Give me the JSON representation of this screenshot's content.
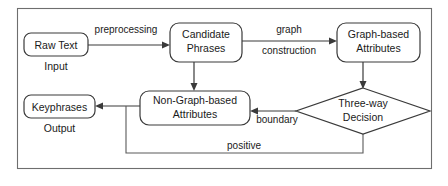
{
  "diagram": {
    "frame": {
      "name": "outer-frame"
    },
    "nodes": [
      {
        "id": "raw-text",
        "label_line1": "Raw Text",
        "label_line2": "",
        "shape": "rounded-rect"
      },
      {
        "id": "candidate-phrases",
        "label_line1": "Candidate",
        "label_line2": "Phrases",
        "shape": "rounded-rect"
      },
      {
        "id": "graph-based",
        "label_line1": "Graph-based",
        "label_line2": "Attributes",
        "shape": "rounded-rect"
      },
      {
        "id": "non-graph-based",
        "label_line1": "Non-Graph-based",
        "label_line2": "Attributes",
        "shape": "rounded-rect"
      },
      {
        "id": "three-way-decision",
        "label_line1": "Three-way",
        "label_line2": "Decision",
        "shape": "diamond"
      },
      {
        "id": "keyphrases",
        "label_line1": "Keyphrases",
        "label_line2": "",
        "shape": "rounded-rect"
      }
    ],
    "io_labels": [
      {
        "id": "input-label",
        "text": "Input"
      },
      {
        "id": "output-label",
        "text": "Output"
      }
    ],
    "edge_labels": [
      {
        "id": "preprocessing-label",
        "text": "preprocessing"
      },
      {
        "id": "graph-label",
        "text": "graph"
      },
      {
        "id": "construction-label",
        "text": "construction"
      },
      {
        "id": "boundary-label",
        "text": "boundary"
      },
      {
        "id": "positive-label",
        "text": "positive"
      }
    ],
    "colors": {
      "background": "#ffffff",
      "shape_stroke": "#3a3a3a",
      "frame_stroke": "#6e6e6e",
      "text": "#1a1a1a"
    }
  }
}
